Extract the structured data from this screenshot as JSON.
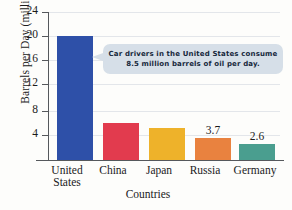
{
  "chart_data": {
    "type": "bar",
    "title": "",
    "xlabel": "Countries",
    "ylabel": "Barrels per Day (millions)",
    "ylim": [
      0,
      25
    ],
    "yticks": [
      4,
      8,
      12,
      16,
      20,
      24
    ],
    "grid": true,
    "legend": "none",
    "categories": [
      "United States",
      "China",
      "Japan",
      "Russia",
      "Germany"
    ],
    "values": [
      20.7,
      6.2,
      5.4,
      3.7,
      2.6
    ],
    "value_labels": [
      "",
      "",
      "",
      "3.7",
      "2.6"
    ],
    "colors": [
      "#2e50a8",
      "#e23b4e",
      "#eeb22a",
      "#e9823f",
      "#4a9e8f"
    ],
    "annotations": [
      {
        "text": "Car drivers in the United States consume 8.5 million barrels of oil per day.",
        "line1": "Car drivers in the United States consume",
        "line2": "8.5 million barrels of oil per day.",
        "points_to": "United States",
        "background": "#d6dfe8"
      }
    ]
  },
  "axis": {
    "y_title": "Barrels per Day (millions)",
    "x_title": "Countries",
    "ticks": [
      "24",
      "20",
      "16",
      "12",
      "8",
      "4"
    ]
  },
  "bars": [
    {
      "label_line1": "United",
      "label_line2": "States",
      "value": 20.7,
      "value_label": "",
      "color": "#2e50a8"
    },
    {
      "label_line1": "China",
      "label_line2": "",
      "value": 6.2,
      "value_label": "",
      "color": "#e23b4e"
    },
    {
      "label_line1": "Japan",
      "label_line2": "",
      "value": 5.4,
      "value_label": "",
      "color": "#eeb22a"
    },
    {
      "label_line1": "Russia",
      "label_line2": "",
      "value": 3.7,
      "value_label": "3.7",
      "color": "#e9823f"
    },
    {
      "label_line1": "Germany",
      "label_line2": "",
      "value": 2.6,
      "value_label": "2.6",
      "color": "#4a9e8f"
    }
  ],
  "callout": {
    "line1": "Car drivers in the United States consume",
    "line2": "8.5 million barrels of oil per day."
  }
}
